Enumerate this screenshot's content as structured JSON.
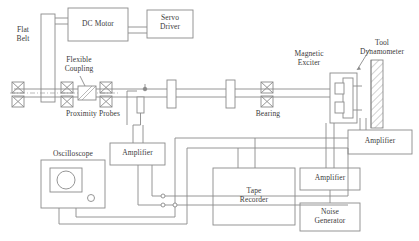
{
  "diagram": {
    "stroke_color": "#8a8a8a",
    "text_color": "#3a3a3a",
    "hatch_color": "#9a9a9a"
  },
  "labels": {
    "flat_belt": "Flat\nBelt",
    "dc_motor": "DC Motor",
    "servo_driver": "Servo\nDriver",
    "flexible_coupling": "Flexible\nCoupling",
    "proximity_probes": "Proximity Probes",
    "bearing": "Bearing",
    "magnetic_exciter": "Magnetic\nExciter",
    "tool_dynamometer": "Tool\nDynamometer",
    "oscilloscope": "Oscilloscope",
    "amplifier_left": "Amplifier",
    "amplifier_right": "Amplifier",
    "amplifier_bottom": "Amplifier",
    "tape_recorder": "Tape\nRecorder",
    "noise_generator": "Noise\nGenerator"
  },
  "blocks": [
    {
      "name": "dc-motor",
      "label": "DC Motor"
    },
    {
      "name": "servo-driver",
      "label": "Servo\nDriver"
    },
    {
      "name": "oscilloscope",
      "label": "Oscilloscope"
    },
    {
      "name": "amplifier-left",
      "label": "Amplifier"
    },
    {
      "name": "amplifier-right",
      "label": "Amplifier"
    },
    {
      "name": "amplifier-bottom",
      "label": "Amplifier"
    },
    {
      "name": "tape-recorder",
      "label": "Tape\nRecorder"
    },
    {
      "name": "noise-generator",
      "label": "Noise\nGenerator"
    }
  ],
  "components": [
    {
      "name": "flat-belt-pulley",
      "label": "Flat\nBelt"
    },
    {
      "name": "flexible-coupling",
      "label": "Flexible\nCoupling"
    },
    {
      "name": "proximity-probes",
      "label": "Proximity Probes"
    },
    {
      "name": "bearing",
      "label": "Bearing"
    },
    {
      "name": "magnetic-exciter",
      "label": "Magnetic\nExciter"
    },
    {
      "name": "tool-dynamometer",
      "label": "Tool\nDynamometer"
    }
  ]
}
